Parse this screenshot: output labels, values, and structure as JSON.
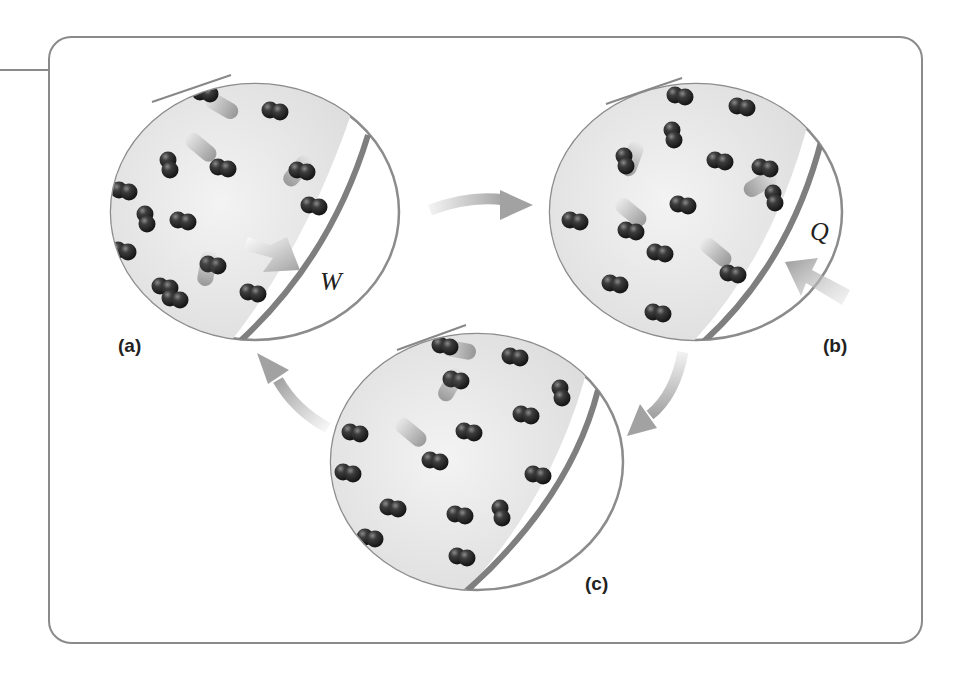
{
  "figure": {
    "colors": {
      "frame": "#8a8a8a",
      "circle_outline": "#8c8c8c",
      "piston": "#7f7f7f",
      "gas_fill": "#e4e4e4",
      "molecule": "#2e2e2e",
      "arrow": "#a9a9a9"
    },
    "panels": [
      {
        "id": "a",
        "label": "(a)",
        "symbol": "W",
        "symbol_meaning": "work",
        "arrow_direction": "outward toward piston"
      },
      {
        "id": "b",
        "label": "(b)",
        "symbol": "Q",
        "symbol_meaning": "heat",
        "arrow_direction": "inward through wall"
      },
      {
        "id": "c",
        "label": "(c)",
        "symbol": "",
        "symbol_meaning": "",
        "arrow_direction": ""
      }
    ],
    "cycle_arrows": [
      {
        "from": "a",
        "to": "b"
      },
      {
        "from": "b",
        "to": "c"
      },
      {
        "from": "c",
        "to": "a"
      }
    ]
  }
}
